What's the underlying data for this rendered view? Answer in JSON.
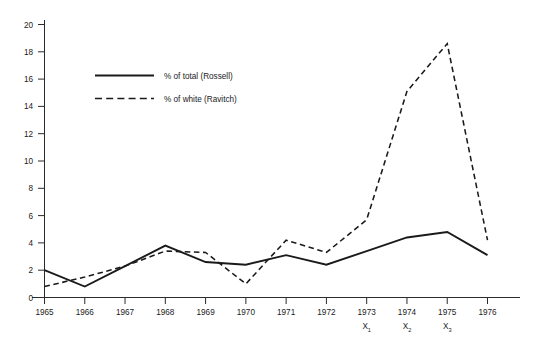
{
  "chart_data": {
    "type": "line",
    "title": "",
    "subtitle": "",
    "xlabel": "",
    "ylabel": "",
    "categories": [
      "1965",
      "1966",
      "1967",
      "1968",
      "1969",
      "1970",
      "1971",
      "1972",
      "1973",
      "1974",
      "1975",
      "1976"
    ],
    "x": [
      1965,
      1966,
      1967,
      1968,
      1969,
      1970,
      1971,
      1972,
      1973,
      1974,
      1975,
      1976
    ],
    "xlim": [
      1965,
      1976
    ],
    "ylim": [
      0,
      20
    ],
    "yticks": [
      0,
      2,
      4,
      6,
      8,
      10,
      12,
      14,
      16,
      18,
      20
    ],
    "ytick_labels": [
      "0",
      "2",
      "4",
      "6",
      "8",
      "10",
      "12",
      "14",
      "16",
      "18",
      "20"
    ],
    "grid": false,
    "legend_position": "upper-left-inset",
    "series": [
      {
        "name": "% of total (Rossell)",
        "style": "solid",
        "color": "#1a1a1a",
        "values": [
          2.0,
          0.8,
          2.3,
          3.8,
          2.6,
          2.4,
          3.1,
          2.4,
          3.4,
          4.4,
          4.8,
          3.1
        ]
      },
      {
        "name": "% of white (Ravitch)",
        "style": "dashed",
        "color": "#1a1a1a",
        "values": [
          0.8,
          1.5,
          2.3,
          3.4,
          3.3,
          1.0,
          4.2,
          3.3,
          5.7,
          15.1,
          18.6,
          4.2
        ]
      }
    ],
    "annotations": [
      {
        "text": "X",
        "subscript": "1",
        "at_category": "1973"
      },
      {
        "text": "X",
        "subscript": "2",
        "at_category": "1974"
      },
      {
        "text": "X",
        "subscript": "3",
        "at_category": "1975"
      }
    ]
  },
  "legend": {
    "entries": [
      {
        "label": "% of total (Rossell)",
        "style": "solid"
      },
      {
        "label": "% of white (Ravitch)",
        "style": "dashed"
      }
    ]
  }
}
